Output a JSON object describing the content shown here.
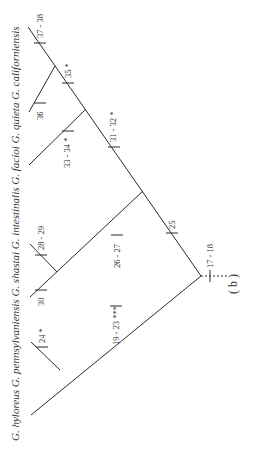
{
  "figure": {
    "panel_label": "( b )",
    "taxa": [
      {
        "id": "hyloreus",
        "label": "G. hyloreus"
      },
      {
        "id": "pennsylvaniensis",
        "label": "G. pennsylvaniensis"
      },
      {
        "id": "shastai",
        "label": "G. shastai"
      },
      {
        "id": "intestinalis",
        "label": "G. intestinalis"
      },
      {
        "id": "facioi",
        "label": "G. facioi"
      },
      {
        "id": "quieta",
        "label": "G. quieta"
      },
      {
        "id": "californiensis",
        "label": "G. californiensis"
      }
    ],
    "character_labels": {
      "root": "17 - 18",
      "c25": "25",
      "c19_23": "19 - 23 ***",
      "c24": "24 *",
      "c26_27": "26 - 27",
      "c28_29": "28 - 29",
      "c30": "30",
      "c31_32": "31 - 32 *",
      "c33_34": "33 - 34 *",
      "c35": "35 *",
      "c36": "36",
      "c37_38": "37 - 38"
    },
    "title_line": "G. hyloreus  G. pennsylvaniensis  G. shastai  G. intestinalis  G. facioi   G. quieta  G. californiensis"
  }
}
